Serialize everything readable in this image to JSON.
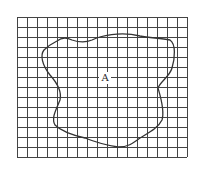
{
  "diagram": {
    "grid": {
      "x0": 17,
      "y0": 17,
      "cell": 10,
      "cols": 17,
      "rows": 14,
      "line_color": "#444444"
    },
    "region": {
      "label": "A",
      "label_x": 105,
      "label_y": 81,
      "stroke": "#333333"
    }
  }
}
